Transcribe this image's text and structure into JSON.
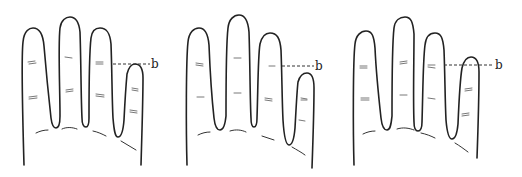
{
  "figure": {
    "line_color": "#222222",
    "background": "#ffffff",
    "hands": [
      {
        "id": "hand-1",
        "marker_label": "b",
        "pinky_tip_position": "at line"
      },
      {
        "id": "hand-2",
        "marker_label": "b",
        "pinky_tip_position": "below line"
      },
      {
        "id": "hand-3",
        "marker_label": "b",
        "pinky_tip_position": "above line"
      }
    ]
  }
}
